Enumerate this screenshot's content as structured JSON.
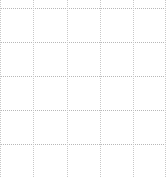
{
  "grid": {
    "line_color": "#b8b8b8",
    "vertical_line_color": "#c8c8c8",
    "background": "#ffffff",
    "style": "dotted",
    "horizontal_lines_y": [
      8,
      42,
      76,
      110,
      144
    ],
    "vertical_lines_x": [
      0,
      33,
      67,
      100,
      133,
      165
    ]
  }
}
